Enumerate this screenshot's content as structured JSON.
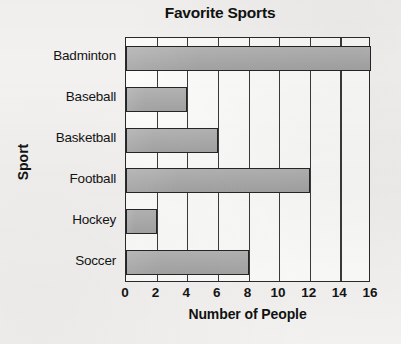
{
  "chart_data": {
    "type": "bar",
    "orientation": "horizontal",
    "title": "Favorite Sports",
    "xlabel": "Number of People",
    "ylabel": "Sport",
    "categories": [
      "Badminton",
      "Baseball",
      "Basketball",
      "Football",
      "Hockey",
      "Soccer"
    ],
    "values": [
      16,
      4,
      6,
      12,
      2,
      8
    ],
    "xlim": [
      0,
      16
    ],
    "xticks": [
      0,
      2,
      4,
      6,
      8,
      10,
      12,
      14,
      16
    ],
    "xtick_labels": [
      "0",
      "2",
      "4",
      "6",
      "8",
      "10",
      "12",
      "14",
      "16"
    ],
    "grid": "vertical",
    "legend": "none",
    "bar_fill_color": "#a9a9a9",
    "bar_border_color": "#252525",
    "plot_background_color": "#fbfbfa",
    "page_background_color": "#f2f1ef"
  }
}
